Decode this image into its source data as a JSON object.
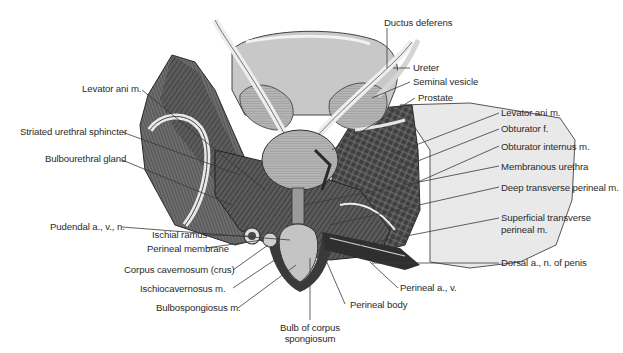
{
  "figure": {
    "colors": {
      "background": "#ffffff",
      "label_text": "#2b2b2b",
      "leader_line": "#3a3a3a",
      "muscle_dark": "#4a4a4a",
      "muscle_mid": "#7a7a7a",
      "organ_light": "#bdbdbd",
      "bladder": "#c9c9c9",
      "bone_light": "#e6e6e6"
    },
    "labels_left": [
      {
        "id": "levator-ani-left",
        "text": "Levator ani m."
      },
      {
        "id": "striated-urethral-sphincter",
        "text": "Striated urethral sphincter"
      },
      {
        "id": "bulbourethral-gland",
        "text": "Bulbourethral gland"
      },
      {
        "id": "pudendal",
        "text": "Pudendal a., v., n."
      },
      {
        "id": "ischial-ramus",
        "text": "Ischial ramus"
      },
      {
        "id": "perineal-membrane",
        "text": "Perineal membrane"
      },
      {
        "id": "corpus-cavernosum",
        "text": "Corpus cavernosum (crus)"
      },
      {
        "id": "ischiocavernosus",
        "text": "Ischiocavernosus m."
      },
      {
        "id": "bulbospongiosus",
        "text": "Bulbospongiosus m."
      }
    ],
    "labels_top": [
      {
        "id": "ductus-deferens",
        "text": "Ductus deferens"
      },
      {
        "id": "ureter",
        "text": "Ureter"
      },
      {
        "id": "seminal-vesicle",
        "text": "Seminal vesicle"
      },
      {
        "id": "prostate",
        "text": "Prostate"
      }
    ],
    "labels_right": [
      {
        "id": "levator-ani-right",
        "text": "Levator ani m."
      },
      {
        "id": "obturator-f",
        "text": "Obturator f."
      },
      {
        "id": "obturator-internus",
        "text": "Obturator internus m."
      },
      {
        "id": "membranous-urethra",
        "text": "Membranous urethra"
      },
      {
        "id": "deep-transverse-perineal",
        "text": "Deep transverse perineal m."
      },
      {
        "id": "superficial-transverse-perineal-1",
        "text": "Superficial transverse"
      },
      {
        "id": "superficial-transverse-perineal-2",
        "text": "perineal m."
      },
      {
        "id": "dorsal-penis",
        "text": "Dorsal a., n. of penis"
      }
    ],
    "labels_bottom": [
      {
        "id": "perineal-av",
        "text": "Perineal a., v."
      },
      {
        "id": "perineal-body",
        "text": "Perineal body"
      },
      {
        "id": "bulb-corpus-spongiosum-1",
        "text": "Bulb of corpus"
      },
      {
        "id": "bulb-corpus-spongiosum-2",
        "text": "spongiosum"
      }
    ]
  }
}
